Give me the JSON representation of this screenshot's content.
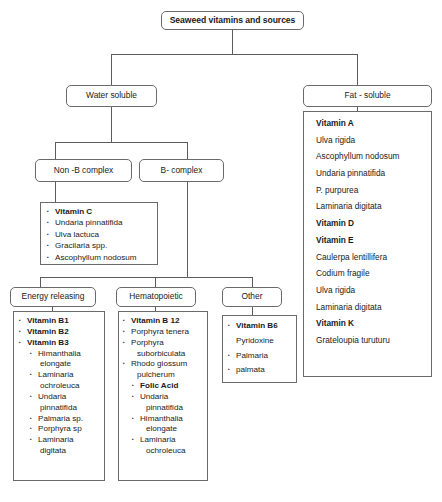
{
  "diagram": {
    "title": "Seaweed vitamins and sources",
    "root": {
      "label": "Seaweed vitamins and sources"
    },
    "level1": {
      "water_soluble": {
        "label": "Water soluble"
      },
      "fat_soluble": {
        "label": "Fat - soluble"
      }
    },
    "level2": {
      "non_b_complex": {
        "label": "Non -B complex"
      },
      "b_complex": {
        "label": "B- complex"
      }
    },
    "level3": {
      "energy_releasing": {
        "label": "Energy releasing"
      },
      "hematopoietic": {
        "label": "Hematopoietic"
      },
      "other": {
        "label": "Other"
      }
    },
    "fat_soluble_content": {
      "items": [
        {
          "text": "Vitamin A",
          "bold": true
        },
        {
          "text": "Ulva rigida",
          "bold": false
        },
        {
          "text": "Ascophyllum nodosum",
          "bold": false
        },
        {
          "text": "Undaria pinnatifida",
          "bold": false
        },
        {
          "text": "P. purpurea",
          "bold": false
        },
        {
          "text": "Laminaria digitata",
          "bold": false
        },
        {
          "text": "Vitamin D",
          "bold": true
        },
        {
          "text": "Vitamin E",
          "bold": true
        },
        {
          "text": "Caulerpa lentillifera",
          "bold": false
        },
        {
          "text": "Codium fragile",
          "bold": false
        },
        {
          "text": "Ulva rigida",
          "bold": false
        },
        {
          "text": "Laminaria digitata",
          "bold": false
        },
        {
          "text": "Vitamin K",
          "bold": true
        },
        {
          "text": "Grateloupia turuturu",
          "bold": false
        }
      ]
    },
    "vitamin_c_content": {
      "items": [
        {
          "text": "Vitamin C",
          "bold": true,
          "bullet": true
        },
        {
          "text": "Undaria pinnatifida",
          "bold": false,
          "bullet": true
        },
        {
          "text": "Ulva lactuca",
          "bold": false,
          "bullet": true
        },
        {
          "text": "Gracilaria spp.",
          "bold": false,
          "bullet": true
        },
        {
          "text": "Ascophyllum nodosum",
          "bold": false,
          "bullet": true
        }
      ]
    },
    "energy_releasing_content": {
      "items": [
        {
          "text": "Vitamin B1",
          "bold": true,
          "bullet": true,
          "indent": 0
        },
        {
          "text": "Vitamin B2",
          "bold": true,
          "bullet": true,
          "indent": 0
        },
        {
          "text": "Vitamin B3",
          "bold": true,
          "bullet": true,
          "indent": 0
        },
        {
          "text": "Himanthalia",
          "bold": false,
          "bullet": true,
          "indent": 1
        },
        {
          "text": "elongate",
          "bold": false,
          "bullet": false,
          "indent": 2
        },
        {
          "text": "Laminaria",
          "bold": false,
          "bullet": true,
          "indent": 1
        },
        {
          "text": "ochroleuca",
          "bold": false,
          "bullet": false,
          "indent": 2
        },
        {
          "text": "Undaria",
          "bold": false,
          "bullet": true,
          "indent": 1
        },
        {
          "text": "pinnatifida",
          "bold": false,
          "bullet": false,
          "indent": 2
        },
        {
          "text": "Palmaria sp.",
          "bold": false,
          "bullet": true,
          "indent": 1
        },
        {
          "text": "Porphyra sp",
          "bold": false,
          "bullet": true,
          "indent": 1
        },
        {
          "text": "Laminaria",
          "bold": false,
          "bullet": true,
          "indent": 1
        },
        {
          "text": "digitata",
          "bold": false,
          "bullet": false,
          "indent": 2
        }
      ]
    },
    "hematopoietic_content": {
      "items": [
        {
          "text": "Vitamin B 12",
          "bold": true,
          "bullet": true,
          "indent": 0
        },
        {
          "text": "Porphyra tenera",
          "bold": false,
          "bullet": true,
          "indent": 0
        },
        {
          "text": "Porphyra",
          "bold": false,
          "bullet": true,
          "indent": 0
        },
        {
          "text": "suborbiculata",
          "bold": false,
          "bullet": false,
          "indent": 3
        },
        {
          "text": "Rhodo giossum",
          "bold": false,
          "bullet": true,
          "indent": 0
        },
        {
          "text": "pulcherum",
          "bold": false,
          "bullet": false,
          "indent": 3
        },
        {
          "text": "Folic Acid",
          "bold": true,
          "bullet": true,
          "indent": 1
        },
        {
          "text": "Undaria",
          "bold": false,
          "bullet": true,
          "indent": 1
        },
        {
          "text": "pinnatifida",
          "bold": false,
          "bullet": false,
          "indent": 4
        },
        {
          "text": "Himanthalia",
          "bold": false,
          "bullet": true,
          "indent": 1
        },
        {
          "text": "elongate",
          "bold": false,
          "bullet": false,
          "indent": 4
        },
        {
          "text": "Laminaria",
          "bold": false,
          "bullet": true,
          "indent": 1
        },
        {
          "text": "ochroleuca",
          "bold": false,
          "bullet": false,
          "indent": 4
        }
      ]
    },
    "other_content": {
      "items": [
        {
          "text": "Vitamin B6",
          "bold": true,
          "bullet": true
        },
        {
          "text": "Pyridoxine",
          "bold": false,
          "bullet": false
        },
        {
          "text": "Palmaria",
          "bold": false,
          "bullet": true
        },
        {
          "text": "palmata",
          "bold": false,
          "bullet": true
        }
      ]
    }
  },
  "colors": {
    "line": "#5c5c5c",
    "border": "#6a6a6a",
    "text": "#1a1a1a",
    "background": "#ffffff"
  }
}
